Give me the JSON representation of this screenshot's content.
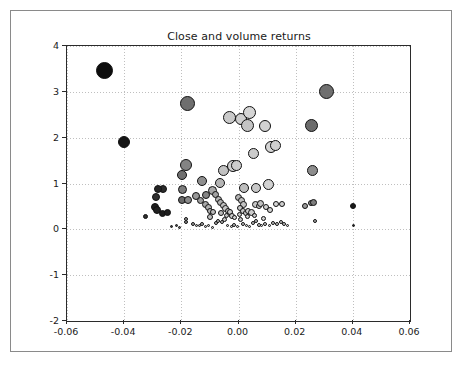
{
  "figure": {
    "width": 462,
    "height": 365,
    "background_color": "#ffffff",
    "border_color": "#8a8a8a"
  },
  "chart_data": {
    "type": "scatter",
    "title": "Close and volume returns",
    "xlabel": "",
    "ylabel": "",
    "xlim": [
      -0.06,
      0.06
    ],
    "ylim": [
      -2,
      4
    ],
    "xticks": [
      -0.06,
      -0.04,
      -0.02,
      0.0,
      0.02,
      0.04,
      0.06
    ],
    "xticklabels": [
      "-0.06",
      "-0.04",
      "-0.02",
      "0.00",
      "0.02",
      "0.04",
      "0.06"
    ],
    "yticks": [
      -2,
      -1,
      0,
      1,
      2,
      3,
      4
    ],
    "yticklabels": [
      "-2",
      "-1",
      "0",
      "1",
      "2",
      "3",
      "4"
    ],
    "grid": true,
    "grid_style": "dotted",
    "grid_color": "#bfbfbf",
    "legend": null,
    "marker": "circle",
    "marker_edge_color": "#111111",
    "size_encodes": "volume",
    "color_encodes": "volume",
    "points": [
      {
        "x": -0.0468,
        "y": 3.46,
        "s": 17,
        "c": "#0d0d0d"
      },
      {
        "x": -0.04,
        "y": 1.9,
        "s": 12,
        "c": "#151515"
      },
      {
        "x": -0.0178,
        "y": 2.75,
        "s": 15,
        "c": "#6e6e6e"
      },
      {
        "x": 0.0308,
        "y": 3.0,
        "s": 15,
        "c": "#707070"
      },
      {
        "x": 0.0255,
        "y": 2.27,
        "s": 13,
        "c": "#6b6b6b"
      },
      {
        "x": -0.0033,
        "y": 2.44,
        "s": 13,
        "c": "#c9c9c9"
      },
      {
        "x": 0.001,
        "y": 2.4,
        "s": 12,
        "c": "#cfcfcf"
      },
      {
        "x": 0.0039,
        "y": 2.55,
        "s": 13,
        "c": "#d5d5d5"
      },
      {
        "x": 0.0031,
        "y": 2.26,
        "s": 13,
        "c": "#c4c4c4"
      },
      {
        "x": 0.0093,
        "y": 2.26,
        "s": 12,
        "c": "#d2d2d2"
      },
      {
        "x": 0.0113,
        "y": 1.79,
        "s": 12,
        "c": "#d4d4d4"
      },
      {
        "x": 0.0128,
        "y": 1.82,
        "s": 11,
        "c": "#d0d0d0"
      },
      {
        "x": 0.0052,
        "y": 1.66,
        "s": 11,
        "c": "#cbcbcb"
      },
      {
        "x": -0.0185,
        "y": 1.4,
        "s": 12,
        "c": "#838383"
      },
      {
        "x": -0.0196,
        "y": 1.19,
        "s": 10,
        "c": "#6f6f6f"
      },
      {
        "x": 0.026,
        "y": 1.29,
        "s": 11,
        "c": "#8d8d8d"
      },
      {
        "x": -0.0053,
        "y": 1.29,
        "s": 11,
        "c": "#c2c2c2"
      },
      {
        "x": -0.002,
        "y": 1.38,
        "s": 12,
        "c": "#d0d0d0"
      },
      {
        "x": -0.0008,
        "y": 1.39,
        "s": 11,
        "c": "#cccccc"
      },
      {
        "x": 0.0106,
        "y": 0.98,
        "s": 11,
        "c": "#d2d2d2"
      },
      {
        "x": -0.0128,
        "y": 1.05,
        "s": 10,
        "c": "#8f8f8f"
      },
      {
        "x": -0.0066,
        "y": 1.02,
        "s": 10,
        "c": "#b4b4b4"
      },
      {
        "x": -0.0196,
        "y": 0.87,
        "s": 9,
        "c": "#7c7c7c"
      },
      {
        "x": 0.0018,
        "y": 0.9,
        "s": 10,
        "c": "#bdbdbd"
      },
      {
        "x": 0.0062,
        "y": 0.9,
        "s": 10,
        "c": "#c7c7c7"
      },
      {
        "x": -0.0091,
        "y": 0.84,
        "s": 9,
        "c": "#a8a8a8"
      },
      {
        "x": -0.0265,
        "y": 0.89,
        "s": 8,
        "c": "#2b2b2b"
      },
      {
        "x": -0.028,
        "y": 0.88,
        "s": 8,
        "c": "#242424"
      },
      {
        "x": -0.0289,
        "y": 0.7,
        "s": 8,
        "c": "#2e2e2e"
      },
      {
        "x": -0.0292,
        "y": 0.48,
        "s": 8,
        "c": "#1f1f1f"
      },
      {
        "x": -0.0286,
        "y": 0.42,
        "s": 8,
        "c": "#212121"
      },
      {
        "x": -0.0266,
        "y": 0.35,
        "s": 7,
        "c": "#1c1c1c"
      },
      {
        "x": -0.025,
        "y": 0.36,
        "s": 7,
        "c": "#1e1e1e"
      },
      {
        "x": -0.0324,
        "y": 0.27,
        "s": 5,
        "c": "#303030"
      },
      {
        "x": -0.0198,
        "y": 0.63,
        "s": 8,
        "c": "#6a6a6a"
      },
      {
        "x": -0.0176,
        "y": 0.63,
        "s": 8,
        "c": "#8a8a8a"
      },
      {
        "x": -0.0148,
        "y": 0.72,
        "s": 8,
        "c": "#989898"
      },
      {
        "x": -0.0133,
        "y": 0.62,
        "s": 7,
        "c": "#9e9e9e"
      },
      {
        "x": -0.0117,
        "y": 0.55,
        "s": 7,
        "c": "#a9a9a9"
      },
      {
        "x": -0.0106,
        "y": 0.47,
        "s": 7,
        "c": "#b0b0b0"
      },
      {
        "x": -0.0098,
        "y": 0.41,
        "s": 6,
        "c": "#b6b6b6"
      },
      {
        "x": -0.0088,
        "y": 0.37,
        "s": 6,
        "c": "#bcbcbc"
      },
      {
        "x": -0.01,
        "y": 0.28,
        "s": 6,
        "c": "#c2c2c2"
      },
      {
        "x": -0.0112,
        "y": 0.76,
        "s": 8,
        "c": "#868686"
      },
      {
        "x": -0.0082,
        "y": 0.75,
        "s": 7,
        "c": "#a2a2a2"
      },
      {
        "x": -0.007,
        "y": 0.66,
        "s": 7,
        "c": "#b8b8b8"
      },
      {
        "x": -0.0062,
        "y": 0.58,
        "s": 7,
        "c": "#b2b2b2"
      },
      {
        "x": -0.0052,
        "y": 0.52,
        "s": 7,
        "c": "#c0c0c0"
      },
      {
        "x": -0.0044,
        "y": 0.46,
        "s": 7,
        "c": "#c6c6c6"
      },
      {
        "x": -0.0037,
        "y": 0.4,
        "s": 6,
        "c": "#c4c4c4"
      },
      {
        "x": -0.0028,
        "y": 0.37,
        "s": 6,
        "c": "#cacaca"
      },
      {
        "x": -0.0024,
        "y": 0.3,
        "s": 6,
        "c": "#cccccc"
      },
      {
        "x": -0.0014,
        "y": 0.25,
        "s": 5,
        "c": "#d0d0d0"
      },
      {
        "x": 0.0001,
        "y": 0.69,
        "s": 7,
        "c": "#b4b4b4"
      },
      {
        "x": 0.0009,
        "y": 0.62,
        "s": 7,
        "c": "#bdbdbd"
      },
      {
        "x": 0.0016,
        "y": 0.55,
        "s": 7,
        "c": "#c2c2c2"
      },
      {
        "x": 0.0005,
        "y": 0.47,
        "s": 6,
        "c": "#c8c8c8"
      },
      {
        "x": 0.0014,
        "y": 0.41,
        "s": 6,
        "c": "#cdcdcd"
      },
      {
        "x": 0.0025,
        "y": 0.36,
        "s": 6,
        "c": "#c9c9c9"
      },
      {
        "x": 0.0034,
        "y": 0.39,
        "s": 6,
        "c": "#d1d1d1"
      },
      {
        "x": 0.0047,
        "y": 0.36,
        "s": 7,
        "c": "#cbcbcb"
      },
      {
        "x": 0.006,
        "y": 0.55,
        "s": 7,
        "c": "#c5c5c5"
      },
      {
        "x": 0.0071,
        "y": 0.5,
        "s": 6,
        "c": "#cacaca"
      },
      {
        "x": 0.0078,
        "y": 0.56,
        "s": 7,
        "c": "#c0c0c0"
      },
      {
        "x": 0.0096,
        "y": 0.48,
        "s": 6,
        "c": "#d2d2d2"
      },
      {
        "x": 0.011,
        "y": 0.43,
        "s": 6,
        "c": "#d4d4d4"
      },
      {
        "x": 0.0132,
        "y": 0.55,
        "s": 6,
        "c": "#d6d6d6"
      },
      {
        "x": 0.0152,
        "y": 0.56,
        "s": 6,
        "c": "#d0d0d0"
      },
      {
        "x": 0.0232,
        "y": 0.52,
        "s": 6,
        "c": "#9b9b9b"
      },
      {
        "x": 0.0253,
        "y": 0.57,
        "s": 6,
        "c": "#888888"
      },
      {
        "x": 0.0264,
        "y": 0.58,
        "s": 7,
        "c": "#7e7e7e"
      },
      {
        "x": 0.04,
        "y": 0.5,
        "s": 6,
        "c": "#1a1a1a"
      },
      {
        "x": 0.0403,
        "y": 0.09,
        "s": 3,
        "c": "#222222"
      },
      {
        "x": 0.0268,
        "y": 0.18,
        "s": 4,
        "c": "#b0b0b0"
      },
      {
        "x": -0.0216,
        "y": 0.09,
        "s": 3,
        "c": "#444444"
      },
      {
        "x": -0.0185,
        "y": 0.17,
        "s": 4,
        "c": "#8b8b8b"
      },
      {
        "x": -0.0183,
        "y": 0.22,
        "s": 4,
        "c": "#9a9a9a"
      },
      {
        "x": -0.016,
        "y": 0.12,
        "s": 4,
        "c": "#a0a0a0"
      },
      {
        "x": -0.0148,
        "y": 0.09,
        "s": 3,
        "c": "#b2b2b2"
      },
      {
        "x": -0.0138,
        "y": 0.08,
        "s": 3,
        "c": "#adadad"
      },
      {
        "x": -0.0127,
        "y": 0.12,
        "s": 4,
        "c": "#b5b5b5"
      },
      {
        "x": -0.0116,
        "y": 0.07,
        "s": 3,
        "c": "#bababa"
      },
      {
        "x": -0.0104,
        "y": 0.09,
        "s": 3,
        "c": "#c0c0c0"
      },
      {
        "x": -0.0092,
        "y": 0.05,
        "s": 3,
        "c": "#c5c5c5"
      },
      {
        "x": -0.008,
        "y": 0.13,
        "s": 4,
        "c": "#b8b8b8"
      },
      {
        "x": -0.007,
        "y": 0.18,
        "s": 4,
        "c": "#bebebe"
      },
      {
        "x": -0.0058,
        "y": 0.15,
        "s": 4,
        "c": "#c3c3c3"
      },
      {
        "x": -0.0048,
        "y": 0.22,
        "s": 5,
        "c": "#c6c6c6"
      },
      {
        "x": -0.0038,
        "y": 0.09,
        "s": 3,
        "c": "#cacaca"
      },
      {
        "x": -0.0026,
        "y": 0.07,
        "s": 3,
        "c": "#cdcdcd"
      },
      {
        "x": -0.0014,
        "y": 0.1,
        "s": 4,
        "c": "#c8c8c8"
      },
      {
        "x": -0.0004,
        "y": 0.06,
        "s": 3,
        "c": "#d0d0d0"
      },
      {
        "x": 0.0006,
        "y": 0.21,
        "s": 5,
        "c": "#c4c4c4"
      },
      {
        "x": 0.0016,
        "y": 0.12,
        "s": 4,
        "c": "#cbcbcb"
      },
      {
        "x": 0.0027,
        "y": 0.08,
        "s": 3,
        "c": "#d2d2d2"
      },
      {
        "x": 0.0038,
        "y": 0.06,
        "s": 3,
        "c": "#d4d4d4"
      },
      {
        "x": 0.0049,
        "y": 0.14,
        "s": 4,
        "c": "#cecece"
      },
      {
        "x": 0.006,
        "y": 0.18,
        "s": 4,
        "c": "#c9c9c9"
      },
      {
        "x": 0.0071,
        "y": 0.1,
        "s": 4,
        "c": "#d3d3d3"
      },
      {
        "x": 0.0082,
        "y": 0.08,
        "s": 3,
        "c": "#d6d6d6"
      },
      {
        "x": 0.0094,
        "y": 0.12,
        "s": 4,
        "c": "#d0d0d0"
      },
      {
        "x": 0.0108,
        "y": 0.09,
        "s": 3,
        "c": "#d4d4d4"
      },
      {
        "x": 0.0122,
        "y": 0.13,
        "s": 4,
        "c": "#cdcdcd"
      },
      {
        "x": 0.0136,
        "y": 0.12,
        "s": 4,
        "c": "#d1d1d1"
      },
      {
        "x": 0.0148,
        "y": 0.17,
        "s": 4,
        "c": "#d5d5d5"
      },
      {
        "x": 0.016,
        "y": 0.11,
        "s": 4,
        "c": "#cfcfcf"
      },
      {
        "x": 0.0172,
        "y": 0.09,
        "s": 3,
        "c": "#d8d8d8"
      },
      {
        "x": -0.0236,
        "y": 0.06,
        "s": 3,
        "c": "#3a3a3a"
      },
      {
        "x": -0.0206,
        "y": 0.05,
        "s": 3,
        "c": "#5c5c5c"
      },
      {
        "x": -0.006,
        "y": 0.36,
        "s": 6,
        "c": "#b9b9b9"
      },
      {
        "x": -0.0042,
        "y": 0.31,
        "s": 5,
        "c": "#c1c1c1"
      },
      {
        "x": 0.0003,
        "y": 0.33,
        "s": 5,
        "c": "#c7c7c7"
      },
      {
        "x": 0.003,
        "y": 0.27,
        "s": 5,
        "c": "#cbcbcb"
      },
      {
        "x": 0.0056,
        "y": 0.3,
        "s": 5,
        "c": "#c5c5c5"
      },
      {
        "x": 0.0086,
        "y": 0.24,
        "s": 5,
        "c": "#d0d0d0"
      }
    ]
  }
}
